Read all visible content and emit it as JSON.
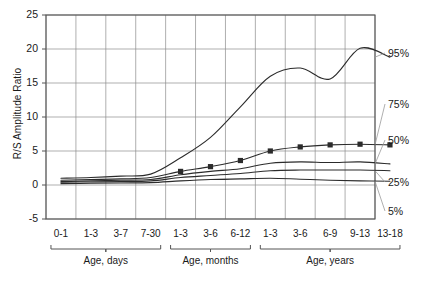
{
  "chart_data": {
    "type": "line",
    "title": "",
    "xlabel": "",
    "ylabel": "R/S Amplitude Ratio",
    "ylim": [
      -5,
      25
    ],
    "yticks": [
      -5,
      0,
      5,
      10,
      15,
      20,
      25
    ],
    "grid": true,
    "legend_position": "right-outside",
    "categories": [
      "0-1",
      "1-3",
      "3-7",
      "7-30",
      "1-3",
      "3-6",
      "6-12",
      "1-3",
      "3-6",
      "6-9",
      "9-13",
      "13-18"
    ],
    "x": [
      "0-1",
      "1-3",
      "3-7",
      "7-30",
      "1-3",
      "3-6",
      "6-12",
      "1-3",
      "3-6",
      "6-9",
      "9-13",
      "13-18"
    ],
    "x_groups": [
      {
        "label": "Age, days",
        "categories": [
          "0-1",
          "1-3",
          "3-7",
          "7-30"
        ]
      },
      {
        "label": "Age, months",
        "categories": [
          "1-3",
          "3-6",
          "6-12"
        ]
      },
      {
        "label": "Age, years",
        "categories": [
          "1-3",
          "3-6",
          "6-9",
          "9-13",
          "13-18"
        ]
      }
    ],
    "series": [
      {
        "name": "95%",
        "values": [
          1.0,
          1.1,
          1.3,
          1.6,
          4.0,
          7.0,
          11.5,
          16.0,
          17.2,
          15.6,
          20.1,
          18.8
        ],
        "marker": false
      },
      {
        "name": "75%",
        "values": [
          0.7,
          0.8,
          0.9,
          1.1,
          2.0,
          2.7,
          3.6,
          5.0,
          5.6,
          5.9,
          6.0,
          5.9
        ],
        "marker": true
      },
      {
        "name": "50%",
        "values": [
          0.5,
          0.6,
          0.7,
          0.8,
          1.5,
          2.0,
          2.4,
          3.2,
          3.4,
          3.3,
          3.4,
          3.1
        ],
        "marker": false
      },
      {
        "name": "25%",
        "values": [
          0.4,
          0.45,
          0.5,
          0.6,
          1.1,
          1.4,
          1.7,
          2.1,
          2.2,
          2.2,
          2.2,
          2.1
        ],
        "marker": false
      },
      {
        "name": "5%",
        "values": [
          0.2,
          0.25,
          0.3,
          0.35,
          0.6,
          0.8,
          0.9,
          1.0,
          0.85,
          0.7,
          0.6,
          0.55
        ],
        "marker": false
      }
    ],
    "marker_points": [
      {
        "x": "1-3",
        "y": 2.0
      },
      {
        "x": "3-6",
        "y": 2.7
      },
      {
        "x": "6-12",
        "y": 3.6
      },
      {
        "x": "1-3y",
        "y": 5.0
      },
      {
        "x": "3-6y",
        "y": 5.6
      },
      {
        "x": "6-9",
        "y": 5.9
      },
      {
        "x": "9-13",
        "y": 6.0
      },
      {
        "x": "13-18",
        "y": 5.9
      }
    ],
    "annotations": [
      {
        "label": "95%"
      },
      {
        "label": "75%"
      },
      {
        "label": "50%"
      },
      {
        "label": "25%"
      },
      {
        "label": "5%"
      }
    ],
    "colors": {
      "line": "#2b2b2b",
      "grid": "#8d8d8d",
      "axis": "#555555",
      "leader": "#9a9a9a",
      "background": "#ffffff"
    }
  }
}
